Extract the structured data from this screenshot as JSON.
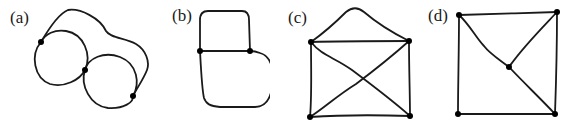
{
  "figure": {
    "panels": [
      {
        "id": "a",
        "label": "(a)",
        "description": "two loops joined at a vertex with an outer edge",
        "vertex_count": 3
      },
      {
        "id": "b",
        "label": "(b)",
        "description": "two faces sharing a horizontal edge",
        "vertex_count": 2
      },
      {
        "id": "c",
        "label": "(c)",
        "description": "rectangle with both diagonals and an arc over the top",
        "vertex_count": 4
      },
      {
        "id": "d",
        "label": "(d)",
        "description": "square with a center vertex connected to three corners",
        "vertex_count": 5
      }
    ],
    "colors": {
      "stroke": "#1a1a1a",
      "vertex": "#000000",
      "background": "#ffffff"
    }
  }
}
